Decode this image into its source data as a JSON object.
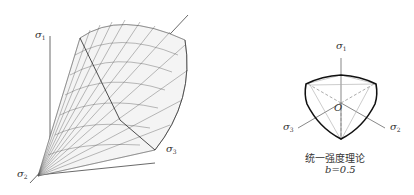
{
  "left_figure": {
    "axes": {
      "sigma1": "σ",
      "sigma1_sub": "1",
      "sigma2": "σ",
      "sigma2_sub": "2",
      "sigma3": "σ",
      "sigma3_sub": "3"
    }
  },
  "right_figure": {
    "axes": {
      "sigma1": "σ",
      "sigma1_sub": "1",
      "sigma2": "σ",
      "sigma2_sub": "2",
      "sigma3": "σ",
      "sigma3_sub": "3",
      "origin": "O"
    },
    "caption_line1": "统一强度理论",
    "caption_line2": "b=0.5"
  }
}
